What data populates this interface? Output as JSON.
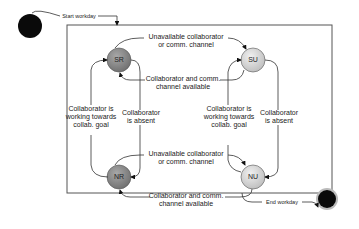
{
  "diagram": {
    "start_label": "Start workday",
    "end_label": "End workday",
    "states": [
      {
        "id": "SR",
        "label": "SR",
        "color": "#8c8c8c"
      },
      {
        "id": "SU",
        "label": "SU",
        "color": "#d6d6d6"
      },
      {
        "id": "NR",
        "label": "NR",
        "color": "#8c8c8c"
      },
      {
        "id": "NU",
        "label": "NU",
        "color": "#d6d6d6"
      }
    ],
    "transitions": {
      "top_unavailable": [
        "Unavailable collaborator",
        "or comm. channel"
      ],
      "top_available": [
        "Collaborator and comm.",
        "channel available"
      ],
      "bottom_unavailable": [
        "Unavailable collaborator",
        "or comm. channel"
      ],
      "bottom_available": [
        "Collaborator and comm.",
        "channel available"
      ],
      "left_working": [
        "Collaborator is",
        "working towards",
        "collab. goal"
      ],
      "left_absent": [
        "Collaborator",
        "is absent"
      ],
      "right_working": [
        "Collaborator is",
        "working towards",
        "collab. goal"
      ],
      "right_absent": [
        "Collaborator",
        "is absent"
      ]
    }
  }
}
